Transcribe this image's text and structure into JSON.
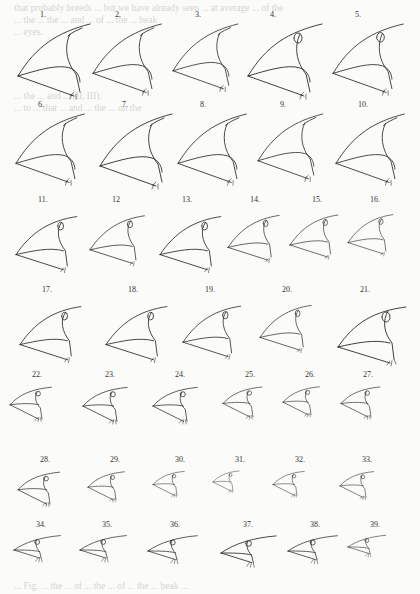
{
  "plate": {
    "title": "Bird beak drawings plate",
    "bleed_through_top": [
      "that probably breeds ... but we have already seen ... at average ... of the",
      "... the ... the ... and ... of ... the ... beak",
      "... eyes."
    ],
    "bleed_through_mid": [
      "... the ... and ... (II, III).",
      "... to ... that ... and ... the ... on the"
    ],
    "bleed_through_bottom": "... Fig. ... the ... of ... the ... of ... the ... beak ...",
    "rows": [
      {
        "y": 10,
        "figures": [
          {
            "label": "1.",
            "x": 40,
            "scale": 1.0,
            "style": "large"
          },
          {
            "label": "2.",
            "x": 115,
            "scale": 0.95,
            "style": "large"
          },
          {
            "label": "3.",
            "x": 195,
            "scale": 0.9,
            "style": "large"
          },
          {
            "label": "4.",
            "x": 270,
            "scale": 1.0,
            "style": "large-eye"
          },
          {
            "label": "5.",
            "x": 355,
            "scale": 0.95,
            "style": "large-eye"
          }
        ]
      },
      {
        "y": 100,
        "figures": [
          {
            "label": "6.",
            "x": 38,
            "scale": 0.95,
            "style": "large"
          },
          {
            "label": "7.",
            "x": 122,
            "scale": 1.0,
            "style": "large"
          },
          {
            "label": "8.",
            "x": 200,
            "scale": 0.95,
            "style": "large"
          },
          {
            "label": "9.",
            "x": 280,
            "scale": 0.9,
            "style": "large"
          },
          {
            "label": "10.",
            "x": 358,
            "scale": 0.95,
            "style": "large"
          }
        ]
      },
      {
        "y": 195,
        "figures": [
          {
            "label": "11.",
            "x": 38,
            "scale": 0.95,
            "style": "medium"
          },
          {
            "label": "12",
            "x": 112,
            "scale": 0.85,
            "style": "medium"
          },
          {
            "label": "13.",
            "x": 182,
            "scale": 0.95,
            "style": "medium"
          },
          {
            "label": "14.",
            "x": 250,
            "scale": 0.8,
            "style": "medium"
          },
          {
            "label": "15.",
            "x": 312,
            "scale": 0.75,
            "style": "medium"
          },
          {
            "label": "16.",
            "x": 370,
            "scale": 0.7,
            "style": "medium"
          }
        ]
      },
      {
        "y": 285,
        "figures": [
          {
            "label": "17.",
            "x": 42,
            "scale": 0.95,
            "style": "medium"
          },
          {
            "label": "18.",
            "x": 128,
            "scale": 0.95,
            "style": "medium"
          },
          {
            "label": "19.",
            "x": 205,
            "scale": 0.9,
            "style": "medium"
          },
          {
            "label": "20.",
            "x": 282,
            "scale": 0.8,
            "style": "medium"
          },
          {
            "label": "21.",
            "x": 360,
            "scale": 1.0,
            "style": "medium-eye"
          }
        ]
      },
      {
        "y": 370,
        "figures": [
          {
            "label": "22.",
            "x": 32,
            "scale": 0.8,
            "style": "small"
          },
          {
            "label": "23.",
            "x": 105,
            "scale": 0.85,
            "style": "small"
          },
          {
            "label": "24.",
            "x": 175,
            "scale": 0.85,
            "style": "small"
          },
          {
            "label": "25.",
            "x": 245,
            "scale": 0.75,
            "style": "small"
          },
          {
            "label": "26.",
            "x": 305,
            "scale": 0.7,
            "style": "small"
          },
          {
            "label": "27.",
            "x": 363,
            "scale": 0.75,
            "style": "small"
          }
        ]
      },
      {
        "y": 455,
        "figures": [
          {
            "label": "28.",
            "x": 40,
            "scale": 0.8,
            "style": "small"
          },
          {
            "label": "29.",
            "x": 110,
            "scale": 0.7,
            "style": "small"
          },
          {
            "label": "30.",
            "x": 175,
            "scale": 0.6,
            "style": "small"
          },
          {
            "label": "31.",
            "x": 235,
            "scale": 0.5,
            "style": "small"
          },
          {
            "label": "32.",
            "x": 295,
            "scale": 0.6,
            "style": "small"
          },
          {
            "label": "33.",
            "x": 362,
            "scale": 0.65,
            "style": "small"
          }
        ]
      },
      {
        "y": 520,
        "figures": [
          {
            "label": "34.",
            "x": 36,
            "scale": 0.8,
            "style": "long"
          },
          {
            "label": "35.",
            "x": 102,
            "scale": 0.8,
            "style": "long"
          },
          {
            "label": "36.",
            "x": 170,
            "scale": 0.85,
            "style": "long"
          },
          {
            "label": "37.",
            "x": 243,
            "scale": 0.95,
            "style": "long"
          },
          {
            "label": "38.",
            "x": 310,
            "scale": 0.85,
            "style": "long"
          },
          {
            "label": "39.",
            "x": 370,
            "scale": 0.65,
            "style": "long"
          }
        ]
      }
    ]
  }
}
